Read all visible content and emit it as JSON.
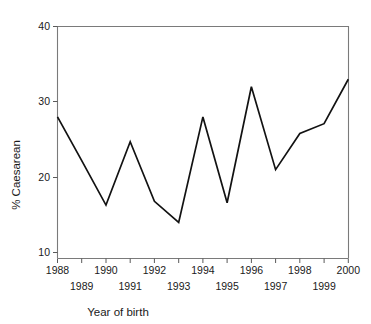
{
  "chart_data": {
    "type": "line",
    "title": "",
    "xlabel": "Year of birth",
    "ylabel": "% Caesarean",
    "categories": [
      "1988",
      "1989",
      "1990",
      "1991",
      "1992",
      "1993",
      "1994",
      "1995",
      "1996",
      "1997",
      "1998",
      "1999",
      "2000"
    ],
    "x": [
      1988,
      1989,
      1990,
      1991,
      1992,
      1993,
      1994,
      1995,
      1996,
      1997,
      1998,
      1999,
      2000
    ],
    "values": [
      28.0,
      22.2,
      16.3,
      24.7,
      16.8,
      14.0,
      28.0,
      16.6,
      32.0,
      21.0,
      25.8,
      27.1,
      33.0
    ],
    "series": [
      {
        "name": "% Caesarean",
        "values": [
          28.0,
          22.2,
          16.3,
          24.7,
          16.8,
          14.0,
          28.0,
          16.6,
          32.0,
          21.0,
          25.8,
          27.1,
          33.0
        ]
      }
    ],
    "xlim": [
      1988,
      2000
    ],
    "ylim": [
      10,
      40
    ],
    "ytick_labels": [
      "10",
      "20",
      "30",
      "40"
    ],
    "yticks": [
      10,
      20,
      30,
      40
    ],
    "xtick_labels_upper": [
      "1988",
      "1990",
      "1992",
      "1994",
      "1996",
      "1998",
      "2000"
    ],
    "xtick_labels_lower": [
      "1989",
      "1991",
      "1993",
      "1995",
      "1997",
      "1999"
    ],
    "grid": false,
    "legend": "none",
    "line_color": "#121212",
    "axis_color": "#7a7a7a",
    "background_color": "#ffffff"
  },
  "axes": {
    "y_title": "% Caesarean",
    "x_title": "Year of birth"
  },
  "y_ticks": [
    {
      "label": "40",
      "value": 40
    },
    {
      "label": "30",
      "value": 30
    },
    {
      "label": "20",
      "value": 20
    },
    {
      "label": "10",
      "value": 10
    }
  ],
  "x_ticks_upper": [
    {
      "label": "1988",
      "value": 1988
    },
    {
      "label": "1990",
      "value": 1990
    },
    {
      "label": "1992",
      "value": 1992
    },
    {
      "label": "1994",
      "value": 1994
    },
    {
      "label": "1996",
      "value": 1996
    },
    {
      "label": "1998",
      "value": 1998
    },
    {
      "label": "2000",
      "value": 2000
    }
  ],
  "x_ticks_lower": [
    {
      "label": "1989",
      "value": 1989
    },
    {
      "label": "1991",
      "value": 1991
    },
    {
      "label": "1993",
      "value": 1993
    },
    {
      "label": "1995",
      "value": 1995
    },
    {
      "label": "1997",
      "value": 1997
    },
    {
      "label": "1999",
      "value": 1999
    }
  ]
}
